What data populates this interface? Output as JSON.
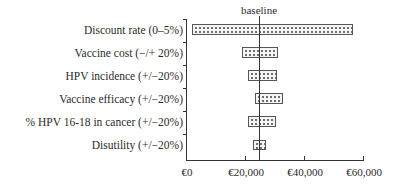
{
  "chart_data": {
    "type": "bar",
    "subtype": "tornado",
    "orientation": "horizontal",
    "title": "",
    "xlabel": "",
    "ylabel": "",
    "baseline_label": "baseline",
    "baseline_value": 24500,
    "xlim": [
      0,
      60000
    ],
    "x_ticks": [
      0,
      20000,
      40000,
      60000
    ],
    "x_tick_labels": [
      "€0",
      "€20,000",
      "€40,000",
      "€60,000"
    ],
    "grid": false,
    "legend": null,
    "categories": [
      "Discount rate (0–5%)",
      "Vaccine cost (−/+ 20%)",
      "HPV incidence (+/−20%)",
      "Vaccine efficacy (+/−20%)",
      "% HPV 16-18 in cancer (+/−20%)",
      "Disutility (+/−20%)"
    ],
    "series": [
      {
        "name": "low",
        "values": [
          1700,
          18800,
          20800,
          23200,
          20800,
          22500
        ]
      },
      {
        "name": "high",
        "values": [
          56500,
          31000,
          30700,
          32700,
          30300,
          26900
        ]
      }
    ],
    "bar_pattern": "dotted",
    "colors": {
      "bar_fill": "#f4f4f4",
      "bar_dots": "#6a6a6a",
      "bar_border": "#555555",
      "axis": "#333333",
      "text": "#2b2b2b"
    }
  }
}
